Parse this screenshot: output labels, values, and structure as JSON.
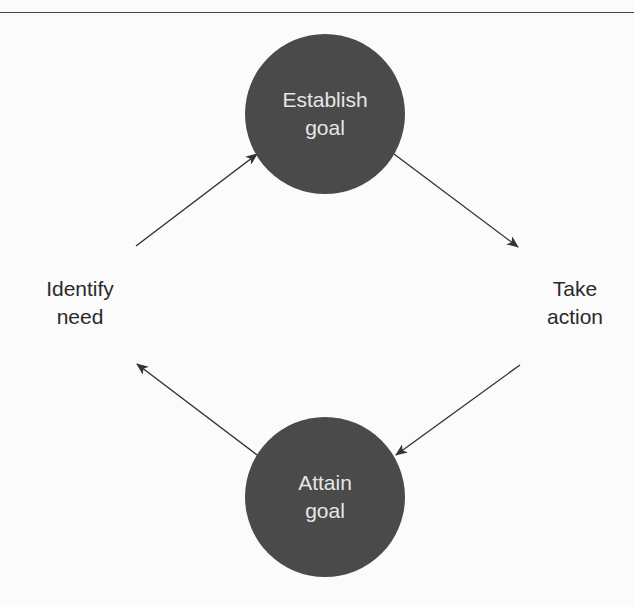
{
  "diagram": {
    "type": "cycle",
    "nodes": [
      {
        "id": "establish-goal",
        "lines": [
          "Establish",
          "goal"
        ],
        "style": "filled-circle"
      },
      {
        "id": "take-action",
        "lines": [
          "Take",
          "action"
        ],
        "style": "text"
      },
      {
        "id": "attain-goal",
        "lines": [
          "Attain",
          "goal"
        ],
        "style": "filled-circle"
      },
      {
        "id": "identify-need",
        "lines": [
          "Identify",
          "need"
        ],
        "style": "text"
      }
    ],
    "edges": [
      {
        "from": "identify-need",
        "to": "establish-goal"
      },
      {
        "from": "establish-goal",
        "to": "take-action"
      },
      {
        "from": "take-action",
        "to": "attain-goal"
      },
      {
        "from": "attain-goal",
        "to": "identify-need"
      }
    ]
  },
  "labels": {
    "top": {
      "line1": "Establish",
      "line2": "goal"
    },
    "right": {
      "line1": "Take",
      "line2": "action"
    },
    "bottom": {
      "line1": "Attain",
      "line2": "goal"
    },
    "left": {
      "line1": "Identify",
      "line2": "need"
    }
  },
  "colors": {
    "background": "#fbfbfb",
    "node_fill": "#4a4a4a",
    "node_text": "#e6e6e6",
    "label_text": "#2a2a2a",
    "arrow": "#333333",
    "rule": "#444444"
  }
}
